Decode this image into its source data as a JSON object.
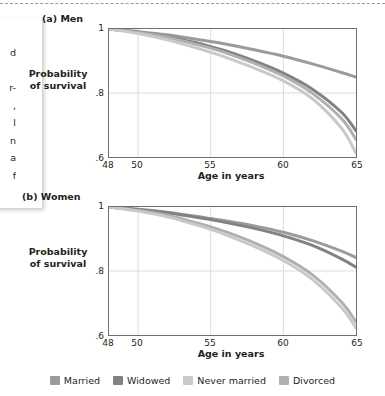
{
  "figure": {
    "background_color": "#ffffff",
    "top_rule": "dashed-separator",
    "text_fragments": [
      "d",
      "",
      "r-",
      ",",
      "l",
      "n",
      "a",
      "f"
    ]
  },
  "legend": {
    "position": "bottom-center",
    "items": [
      {
        "label": "Married",
        "color": "#9b9b9b"
      },
      {
        "label": "Widowed",
        "color": "#828282"
      },
      {
        "label": "Never married",
        "color": "#c9c9c9"
      },
      {
        "label": "Divorced",
        "color": "#b0b0b0"
      }
    ]
  },
  "panels": [
    {
      "id": "men",
      "title": "(a) Men",
      "ylabel_line1": "Probability",
      "ylabel_line2": "of survival",
      "xlabel": "Age in years",
      "yticks": [
        "1",
        ".8",
        ".6"
      ],
      "xticks": [
        "48",
        "50",
        "55",
        "60",
        "65"
      ]
    },
    {
      "id": "women",
      "title": "(b) Women",
      "ylabel_line1": "Probability",
      "ylabel_line2": "of survival",
      "xlabel": "Age in years",
      "yticks": [
        "1",
        ".8",
        ".6"
      ],
      "xticks": [
        "48",
        "50",
        "55",
        "60",
        "65"
      ]
    }
  ],
  "chart_data": [
    {
      "type": "line",
      "id": "men",
      "title": "(a) Men",
      "xlabel": "Age in years",
      "ylabel": "Probability of survival",
      "xlim": [
        48,
        65
      ],
      "ylim": [
        0.6,
        1.0
      ],
      "xticks": [
        48,
        50,
        55,
        60,
        65
      ],
      "yticks": [
        0.6,
        0.8,
        1.0
      ],
      "grid": true,
      "gridlines_x": [
        50,
        55,
        60
      ],
      "gridlines_y": [
        0.8
      ],
      "x": [
        48,
        50,
        52,
        54,
        55,
        56,
        58,
        60,
        62,
        64,
        65
      ],
      "series": [
        {
          "name": "Married",
          "color": "#9b9b9b",
          "values": [
            1.0,
            0.992,
            0.982,
            0.968,
            0.961,
            0.953,
            0.935,
            0.915,
            0.891,
            0.864,
            0.85
          ]
        },
        {
          "name": "Widowed",
          "color": "#828282",
          "values": [
            1.0,
            0.99,
            0.976,
            0.957,
            0.945,
            0.932,
            0.9,
            0.862,
            0.812,
            0.74,
            0.682
          ]
        },
        {
          "name": "Divorced",
          "color": "#b0b0b0",
          "values": [
            1.0,
            0.989,
            0.974,
            0.952,
            0.94,
            0.926,
            0.893,
            0.853,
            0.799,
            0.72,
            0.655
          ]
        },
        {
          "name": "Never married",
          "color": "#c9c9c9",
          "values": [
            1.0,
            0.986,
            0.966,
            0.941,
            0.927,
            0.912,
            0.878,
            0.838,
            0.782,
            0.69,
            0.612
          ]
        }
      ]
    },
    {
      "type": "line",
      "id": "women",
      "title": "(b) Women",
      "xlabel": "Age in years",
      "ylabel": "Probability of survival",
      "xlim": [
        48,
        65
      ],
      "ylim": [
        0.6,
        1.0
      ],
      "xticks": [
        48,
        50,
        55,
        60,
        65
      ],
      "yticks": [
        0.6,
        0.8,
        1.0
      ],
      "grid": true,
      "gridlines_x": [
        50,
        55,
        60
      ],
      "gridlines_y": [
        0.8
      ],
      "x": [
        48,
        50,
        52,
        54,
        55,
        56,
        58,
        60,
        62,
        64,
        65
      ],
      "series": [
        {
          "name": "Married",
          "color": "#9b9b9b",
          "values": [
            1.0,
            0.993,
            0.984,
            0.971,
            0.964,
            0.957,
            0.941,
            0.921,
            0.895,
            0.862,
            0.842
          ]
        },
        {
          "name": "Widowed",
          "color": "#828282",
          "values": [
            1.0,
            0.992,
            0.982,
            0.968,
            0.961,
            0.952,
            0.933,
            0.91,
            0.88,
            0.838,
            0.812
          ]
        },
        {
          "name": "Divorced",
          "color": "#b0b0b0",
          "values": [
            1.0,
            0.989,
            0.974,
            0.951,
            0.938,
            0.923,
            0.888,
            0.845,
            0.788,
            0.703,
            0.641
          ]
        },
        {
          "name": "Never married",
          "color": "#c9c9c9",
          "values": [
            1.0,
            0.987,
            0.969,
            0.944,
            0.93,
            0.914,
            0.877,
            0.833,
            0.774,
            0.686,
            0.622
          ]
        }
      ]
    }
  ]
}
